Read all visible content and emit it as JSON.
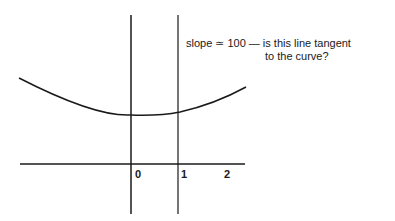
{
  "annotation": {
    "line1": "slope ≃ 100 — is this line tangent",
    "line2": "to the curve?"
  },
  "x_axis": {
    "ticks": [
      "0",
      "1",
      "2"
    ]
  },
  "colors": {
    "ink": "#1a1a1a",
    "background": "#ffffff"
  }
}
